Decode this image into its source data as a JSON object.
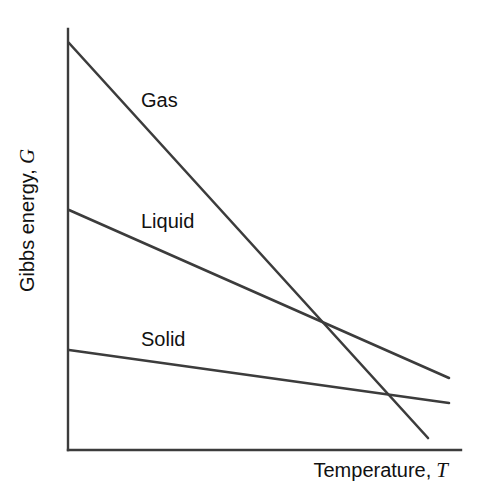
{
  "figure": {
    "background_color": "#ffffff",
    "line_color": "#3c3c3c",
    "text_color": "#111111"
  },
  "axes": {
    "ylabel_text": "Gibbs energy,",
    "ylabel_symbol": "G",
    "xlabel_text": "Temperature,",
    "xlabel_symbol": "T"
  },
  "labels": {
    "gas": "Gas",
    "liquid": "Liquid",
    "solid": "Solid"
  },
  "chart_data": {
    "type": "line",
    "title": "",
    "xlabel": "Temperature, T",
    "ylabel": "Gibbs energy, G",
    "xlim": [
      0,
      100
    ],
    "ylim": [
      0,
      100
    ],
    "grid": false,
    "legend": "inline-annotations",
    "axis_ticks": {
      "x": [],
      "y": []
    },
    "notes": [
      "Schematic thermodynamic plot: Gibbs energy decreases with temperature for each phase.",
      "Slope magnitude equals entropy, so S(gas) > S(liquid) > S(solid).",
      "Solid-liquid intersection marks the melting point; liquid-gas intersection marks the boiling point."
    ],
    "series": [
      {
        "name": "Gas",
        "x": [
          0,
          100
        ],
        "y": [
          96,
          1
        ],
        "slope_label": "steepest (highest entropy)"
      },
      {
        "name": "Liquid",
        "x": [
          0,
          100
        ],
        "y": [
          57,
          18
        ],
        "slope_label": "intermediate entropy"
      },
      {
        "name": "Solid",
        "x": [
          0,
          100
        ],
        "y": [
          24,
          12
        ],
        "slope_label": "shallowest (lowest entropy)"
      }
    ],
    "intersections": [
      {
        "between": [
          "Gas",
          "Liquid"
        ],
        "x": 66,
        "y": 31
      },
      {
        "between": [
          "Gas",
          "Solid"
        ],
        "x": 88,
        "y": 14
      }
    ]
  },
  "geometry": {
    "axis_origin": [
      68,
      450
    ],
    "axis_top": [
      68,
      29
    ],
    "axis_right": [
      461,
      450
    ],
    "gas_line": [
      [
        69,
        43
      ],
      [
        428,
        438
      ]
    ],
    "liquid_line": [
      [
        69,
        210
      ],
      [
        449,
        378
      ]
    ],
    "solid_line": [
      [
        69,
        350
      ],
      [
        449,
        403
      ]
    ]
  }
}
